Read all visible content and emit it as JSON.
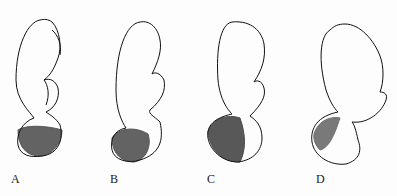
{
  "figure": {
    "panels": [
      {
        "label": "A",
        "description": "fetus head-down, vertex presentation, flexed"
      },
      {
        "label": "B",
        "description": "fetus head-down, head partially deflexed"
      },
      {
        "label": "C",
        "description": "fetus head-down, brow presentation"
      },
      {
        "label": "D",
        "description": "fetus head-down, face presentation, fully extended"
      }
    ],
    "colors": {
      "line": "#111111",
      "background": "#fdfdfd"
    }
  }
}
